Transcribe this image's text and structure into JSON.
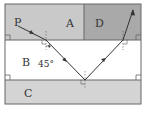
{
  "diagram": {
    "type": "optics-refraction-layers",
    "regions": [
      {
        "id": "A",
        "label": "A",
        "color": "#c9c9c9"
      },
      {
        "id": "D",
        "label": "D",
        "color": "#a9a9a9"
      },
      {
        "id": "B",
        "label": "B",
        "color": "#ffffff"
      },
      {
        "id": "C",
        "label": "C",
        "color": "#d4d4d4"
      }
    ],
    "point_label": "P",
    "angle_label": "45°",
    "line_color": "#333333",
    "border_color": "#666666"
  }
}
